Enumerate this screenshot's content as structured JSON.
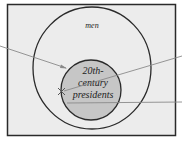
{
  "diagram": {
    "type": "euler",
    "outer_set": {
      "label": "men"
    },
    "inner_set": {
      "label_lines": [
        "20th-",
        "century",
        "presidents"
      ]
    },
    "point_marker": "x",
    "colors": {
      "background": "#ececec",
      "border": "#2a2a2a",
      "inner_fill": "#c6c6c6",
      "pointer_lines": "#8a8a8a"
    }
  }
}
